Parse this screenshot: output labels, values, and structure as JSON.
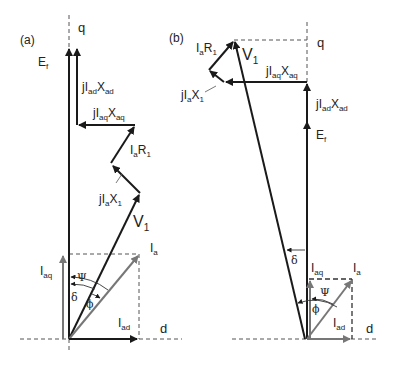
{
  "figure": {
    "panels": [
      {
        "id": "a",
        "label": "(a)",
        "axes": {
          "q": "q",
          "d": "d"
        },
        "phasors": {
          "Ef": {
            "main": "E",
            "sub": "f"
          },
          "jIadXad": {
            "pre": "jI",
            "sub1": "ad",
            "mid": "X",
            "sub2": "ad"
          },
          "jIaqXaq": {
            "pre": "jI",
            "sub1": "aq",
            "mid": "X",
            "sub2": "aq"
          },
          "IaR1": {
            "pre": "I",
            "sub1": "a",
            "mid": "R",
            "sub2": "1"
          },
          "jIaX1": {
            "pre": "jI",
            "sub1": "a",
            "mid": "X",
            "sub2": "1"
          },
          "V1": {
            "main": "V",
            "sub": "1"
          },
          "Ia": {
            "main": "I",
            "sub": "a"
          },
          "Iaq": {
            "main": "I",
            "sub": "aq"
          },
          "Iad": {
            "main": "I",
            "sub": "ad"
          }
        },
        "angles": {
          "psi": "Ψ",
          "delta": "δ",
          "phi": "ϕ"
        }
      },
      {
        "id": "b",
        "label": "(b)",
        "axes": {
          "q": "q",
          "d": "d"
        },
        "phasors": {
          "Ef": {
            "main": "E",
            "sub": "f"
          },
          "jIadXad": {
            "pre": "jI",
            "sub1": "ad",
            "mid": "X",
            "sub2": "ad"
          },
          "jIaqXaq": {
            "pre": "jI",
            "sub1": "aq",
            "mid": "X",
            "sub2": "aq"
          },
          "IaR1": {
            "pre": "I",
            "sub1": "a",
            "mid": "R",
            "sub2": "1"
          },
          "jIaX1": {
            "pre": "jI",
            "sub1": "a",
            "mid": "X",
            "sub2": "1"
          },
          "V1": {
            "main": "V",
            "sub": "1"
          },
          "Ia": {
            "main": "I",
            "sub": "a"
          },
          "Iaq": {
            "main": "I",
            "sub": "aq"
          },
          "Iad": {
            "main": "I",
            "sub": "ad"
          }
        },
        "angles": {
          "psi": "Ψ",
          "delta": "δ",
          "phi": "ϕ"
        }
      }
    ],
    "colors": {
      "black_phasor": "#1a1a1a",
      "gray_phasor": "#777777",
      "dashed": "#555555"
    }
  }
}
